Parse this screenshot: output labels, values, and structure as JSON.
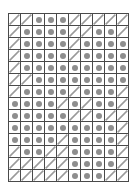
{
  "diagram": {
    "type": "cell-grid",
    "rows": 14,
    "columns": 10,
    "cell_size_px": 11,
    "legend": {
      "dot_label": "filled-dot-cell",
      "slash_label": "diagonal-slash-cell"
    },
    "colors": {
      "cell_border": "#4a4a4a",
      "dot_fill": "#8e8e8e",
      "dot_cell_background": "#e2e2e2",
      "slash_stroke": "#9a9a9a",
      "slash_cell_background": "#ffffff",
      "page_background": "#ffffff"
    },
    "cells": [
      [
        "slash",
        "slash",
        "dot",
        "dot",
        "dot",
        "slash",
        "slash",
        "slash",
        "slash",
        "slash"
      ],
      [
        "slash",
        "dot",
        "dot",
        "dot",
        "dot",
        "slash",
        "slash",
        "dot",
        "dot",
        "slash"
      ],
      [
        "slash",
        "dot",
        "dot",
        "dot",
        "dot",
        "slash",
        "dot",
        "dot",
        "dot",
        "dot"
      ],
      [
        "slash",
        "dot",
        "dot",
        "dot",
        "dot",
        "slash",
        "dot",
        "dot",
        "dot",
        "dot"
      ],
      [
        "slash",
        "dot",
        "dot",
        "dot",
        "dot",
        "dot",
        "dot",
        "dot",
        "dot",
        "dot"
      ],
      [
        "slash",
        "slash",
        "dot",
        "dot",
        "dot",
        "dot",
        "dot",
        "dot",
        "dot",
        "dot"
      ],
      [
        "slash",
        "dot",
        "dot",
        "dot",
        "dot",
        "slash",
        "dot",
        "dot",
        "dot",
        "slash"
      ],
      [
        "dot",
        "dot",
        "dot",
        "dot",
        "slash",
        "dot",
        "slash",
        "dot",
        "dot",
        "slash"
      ],
      [
        "dot",
        "dot",
        "dot",
        "dot",
        "dot",
        "slash",
        "slash",
        "dot",
        "slash",
        "slash"
      ],
      [
        "dot",
        "dot",
        "dot",
        "dot",
        "dot",
        "dot",
        "dot",
        "dot",
        "dot",
        "slash"
      ],
      [
        "dot",
        "dot",
        "dot",
        "dot",
        "slash",
        "dot",
        "dot",
        "dot",
        "dot",
        "slash"
      ],
      [
        "slash",
        "dot",
        "dot",
        "slash",
        "slash",
        "dot",
        "dot",
        "dot",
        "dot",
        "slash"
      ],
      [
        "slash",
        "slash",
        "slash",
        "slash",
        "slash",
        "dot",
        "dot",
        "dot",
        "dot",
        "slash"
      ],
      [
        "slash",
        "slash",
        "slash",
        "slash",
        "slash",
        "dot",
        "dot",
        "dot",
        "slash",
        "slash"
      ]
    ]
  }
}
